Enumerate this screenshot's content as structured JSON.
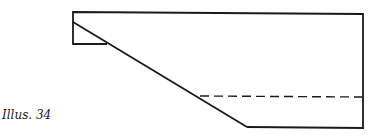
{
  "caption": "Illus. 34",
  "colors": {
    "stroke": "#1a1a1a",
    "background": "#ffffff"
  },
  "diagram": {
    "outline_points": "73,12 363,14 363,128 247,127 73,22",
    "small_rect": {
      "x": 73,
      "y": 12,
      "w": 34,
      "h": 32
    },
    "diagonal": {
      "x1": 73,
      "y1": 22,
      "x2": 247,
      "y2": 127
    },
    "dashed_line": {
      "x1": 200,
      "y1": 96,
      "x2": 363,
      "y2": 97
    }
  }
}
